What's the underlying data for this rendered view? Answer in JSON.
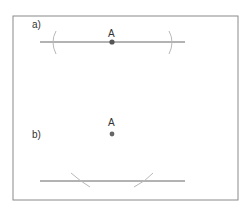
{
  "diagram": {
    "frame": {
      "x": 13,
      "y": 16,
      "width": 225,
      "height": 184,
      "color": "#8a8a8a"
    },
    "panel_a": {
      "label": "a)",
      "point_label": "A",
      "line_color": "#666666",
      "arc_color": "#b8b8b8",
      "point_color": "#555555"
    },
    "panel_b": {
      "label": "b)",
      "point_label": "A",
      "line_color": "#666666",
      "arc_color": "#b8b8b8",
      "point_color": "#666666"
    }
  }
}
